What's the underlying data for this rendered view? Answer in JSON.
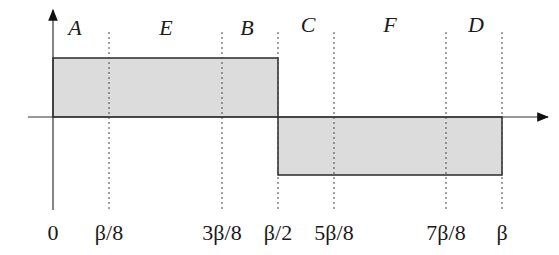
{
  "diagram": {
    "type": "square-wave",
    "region_labels": [
      "A",
      "E",
      "B",
      "C",
      "F",
      "D"
    ],
    "tick_labels": [
      "0",
      "β/8",
      "3β/8",
      "β/2",
      "5β/8",
      "7β/8",
      "β"
    ],
    "colors": {
      "fill": "#dcdcdc",
      "stroke": "#2a2a2a",
      "axis": "#333333"
    },
    "segments": [
      {
        "from": "0",
        "to": "β/2",
        "level": "positive"
      },
      {
        "from": "β/2",
        "to": "β",
        "level": "negative"
      }
    ]
  }
}
